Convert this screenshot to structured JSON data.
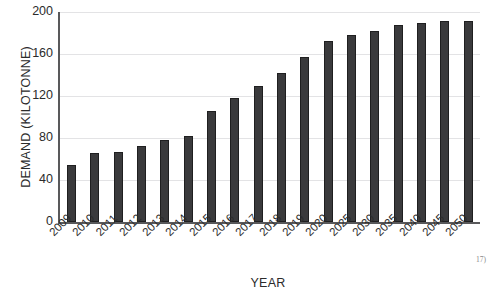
{
  "figure": {
    "footnote_marker": "17)"
  },
  "chart_data": {
    "type": "bar",
    "title": "",
    "xlabel": "YEAR",
    "ylabel": "DEMAND (KILOTONNE)",
    "categories": [
      "2009",
      "2010",
      "2011",
      "2012",
      "2013",
      "2014",
      "2015",
      "2016",
      "2017",
      "2018",
      "2019",
      "2020",
      "2025",
      "2030",
      "2035",
      "2040",
      "2045",
      "2050"
    ],
    "values": [
      54,
      66,
      67,
      72,
      78,
      82,
      106,
      118,
      130,
      142,
      157,
      172,
      178,
      182,
      188,
      190,
      191,
      191
    ],
    "series": [
      {
        "name": "Demand",
        "values": [
          54,
          66,
          67,
          72,
          78,
          82,
          106,
          118,
          130,
          142,
          157,
          172,
          178,
          182,
          188,
          190,
          191,
          191
        ]
      }
    ],
    "ylim": [
      0,
      200
    ],
    "yticks": [
      0,
      40,
      80,
      120,
      160,
      200
    ],
    "ytick_labels": [
      "0",
      "40",
      "80",
      "120",
      "160",
      "200"
    ],
    "grid": "horizontal",
    "legend": "none",
    "bar_color": "#3a3a3c",
    "gridline_color": "#e3e3e5",
    "axis_color": "#59595b"
  }
}
